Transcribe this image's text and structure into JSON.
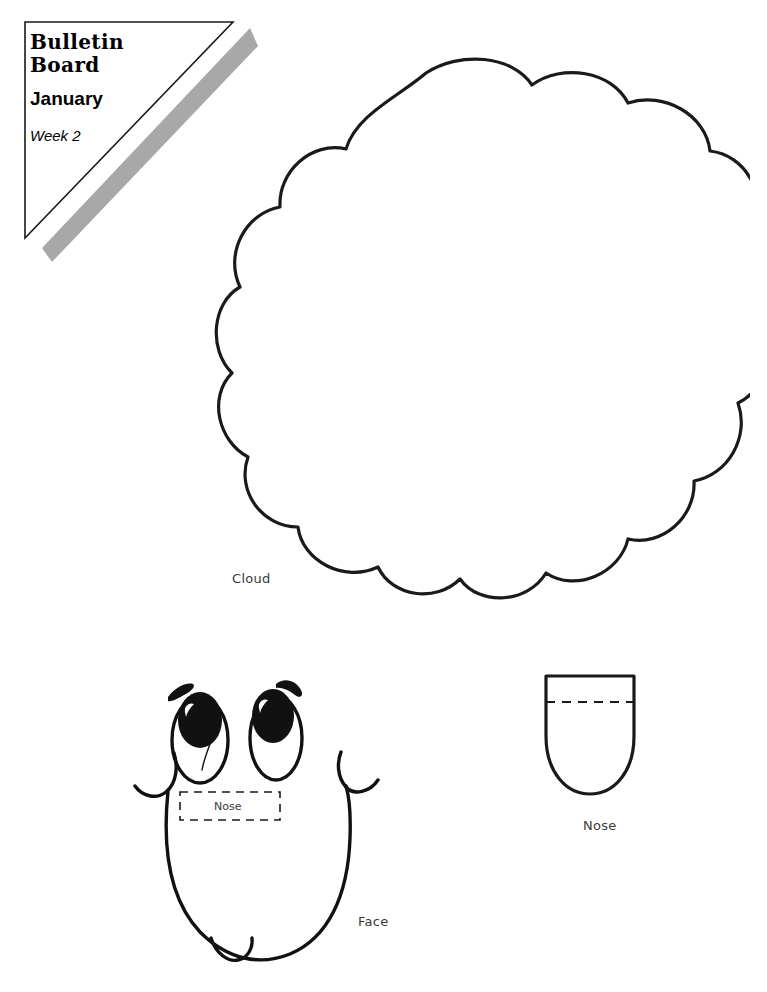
{
  "page": {
    "background_color": "#ffffff",
    "width": 767,
    "height": 992
  },
  "banner": {
    "title_line1": "Bulletin",
    "title_line2": "Board",
    "month": "January",
    "week": "Week 2",
    "shadow_color": "#a8a8a8",
    "outline_color": "#1a1a1a"
  },
  "pieces": [
    {
      "id": "cloud",
      "label": "Cloud",
      "shape": "scalloped-cloud",
      "outline_color": "#1a1a1a"
    },
    {
      "id": "face",
      "label": "Face",
      "shape": "rounded-face-with-eyes",
      "outline_color": "#111111",
      "nose_placeholder_label": "Nose"
    },
    {
      "id": "nose",
      "label": "Nose",
      "shape": "u-shape-with-fold-line",
      "outline_color": "#111111"
    }
  ],
  "labels": {
    "cloud": "Cloud",
    "face": "Face",
    "nose": "Nose",
    "nose_placeholder": "Nose"
  }
}
